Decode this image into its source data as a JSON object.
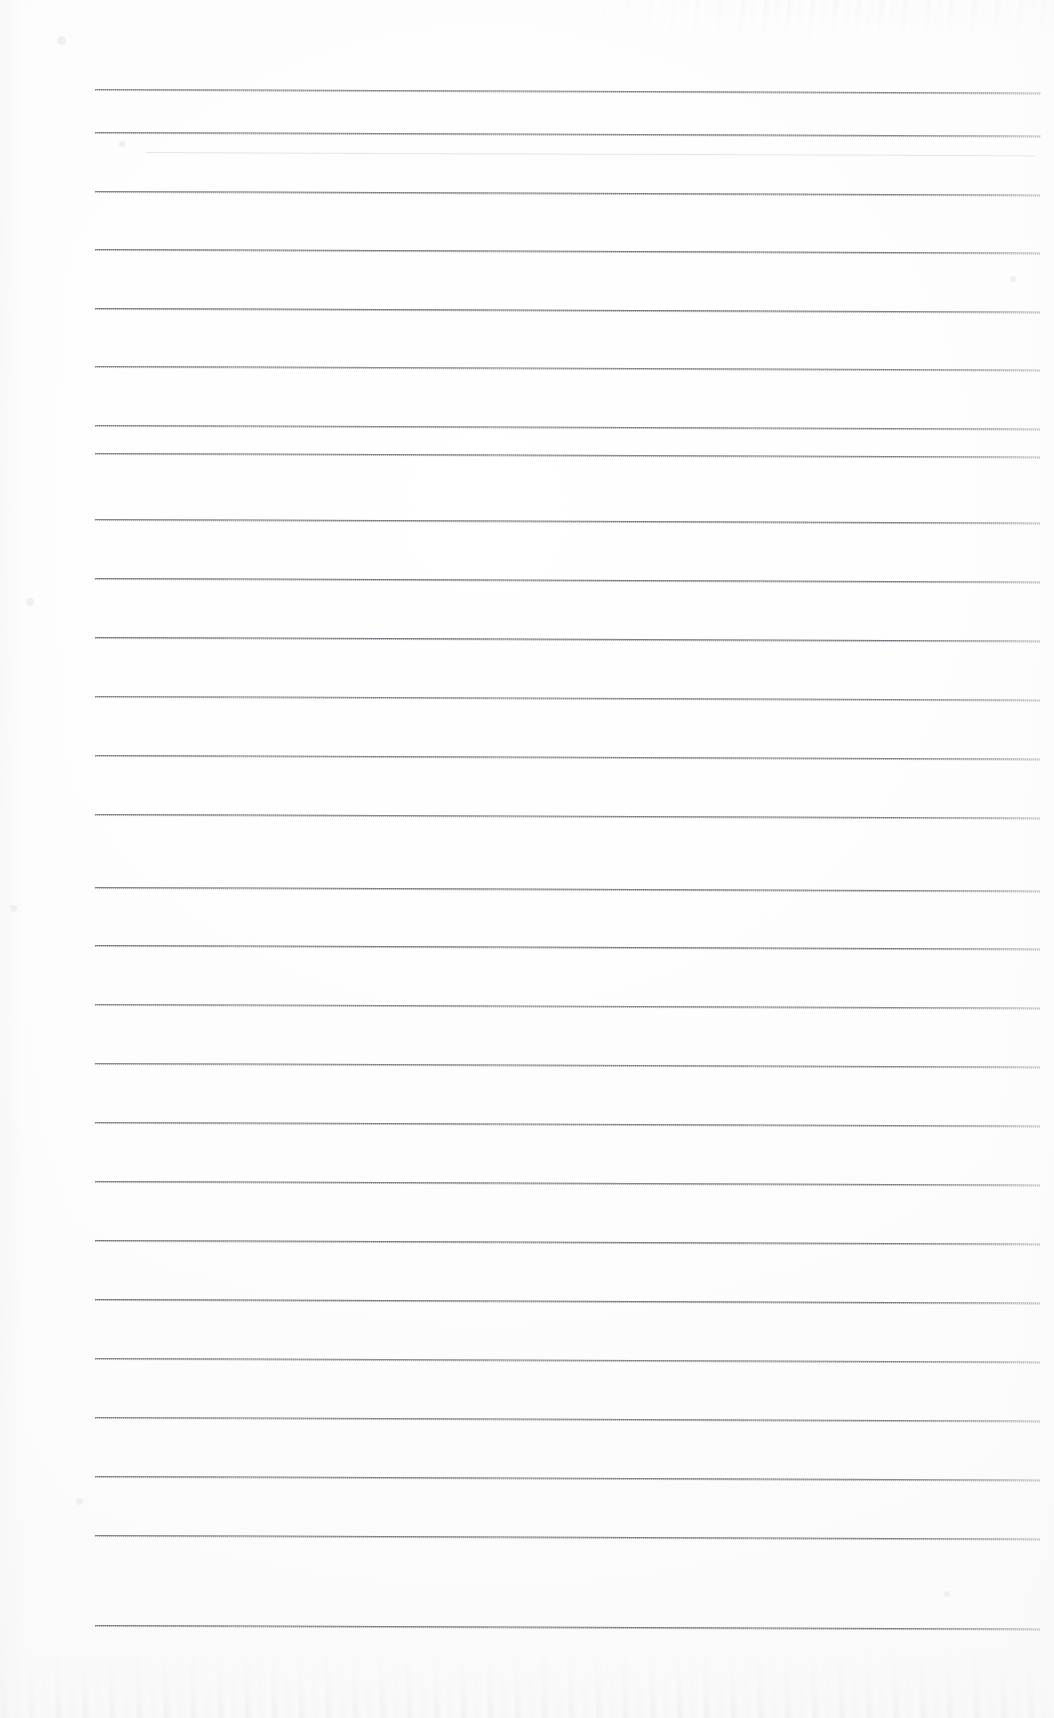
{
  "document": {
    "kind": "scanned-lined-notepad-page",
    "title": "Blank ruled notepad page",
    "page_width": 1054,
    "page_height": 1718,
    "background_color": "#fdfdfd",
    "text_content": "",
    "has_handwriting": false,
    "has_printed_text": false,
    "margin_rule_visible": false
  },
  "ruling": {
    "line_color": "#7a7a82",
    "ghost_line_color": "#d6d6dc",
    "line_thickness_px": 1,
    "line_start_x": 95,
    "line_end_x": 1040,
    "first_line_y": 89,
    "last_line_y": 1625,
    "nominal_spacing_px": 58.8,
    "skew_degrees": 0.22,
    "line_count": 27,
    "lines": [
      {
        "y": 89,
        "x1": 95,
        "x2": 1041,
        "style": "normal"
      },
      {
        "y": 132,
        "x1": 95,
        "x2": 1041,
        "style": "normal"
      },
      {
        "y": 152,
        "x1": 146,
        "x2": 1035,
        "style": "ghost"
      },
      {
        "y": 191,
        "x1": 95,
        "x2": 1040,
        "style": "normal"
      },
      {
        "y": 249,
        "x1": 95,
        "x2": 1040,
        "style": "normal"
      },
      {
        "y": 308,
        "x1": 95,
        "x2": 1040,
        "style": "normal"
      },
      {
        "y": 366,
        "x1": 95,
        "x2": 1040,
        "style": "normal"
      },
      {
        "y": 425,
        "x1": 95,
        "x2": 1040,
        "style": "normal"
      },
      {
        "y": 453,
        "x1": 95,
        "x2": 1040,
        "style": "normal"
      },
      {
        "y": 519,
        "x1": 95,
        "x2": 1040,
        "style": "normal"
      },
      {
        "y": 578,
        "x1": 95,
        "x2": 1040,
        "style": "normal"
      },
      {
        "y": 637,
        "x1": 95,
        "x2": 1040,
        "style": "normal"
      },
      {
        "y": 696,
        "x1": 95,
        "x2": 1040,
        "style": "normal"
      },
      {
        "y": 755,
        "x1": 95,
        "x2": 1040,
        "style": "normal"
      },
      {
        "y": 814,
        "x1": 95,
        "x2": 1040,
        "style": "normal"
      },
      {
        "y": 887,
        "x1": 95,
        "x2": 1040,
        "style": "normal"
      },
      {
        "y": 945,
        "x1": 95,
        "x2": 1040,
        "style": "normal"
      },
      {
        "y": 1004,
        "x1": 95,
        "x2": 1040,
        "style": "normal"
      },
      {
        "y": 1063,
        "x1": 95,
        "x2": 1040,
        "style": "normal"
      },
      {
        "y": 1122,
        "x1": 95,
        "x2": 1040,
        "style": "normal"
      },
      {
        "y": 1181,
        "x1": 95,
        "x2": 1040,
        "style": "normal"
      },
      {
        "y": 1240,
        "x1": 95,
        "x2": 1040,
        "style": "normal"
      },
      {
        "y": 1299,
        "x1": 95,
        "x2": 1040,
        "style": "normal"
      },
      {
        "y": 1358,
        "x1": 95,
        "x2": 1040,
        "style": "normal"
      },
      {
        "y": 1417,
        "x1": 95,
        "x2": 1040,
        "style": "normal"
      },
      {
        "y": 1476,
        "x1": 95,
        "x2": 1040,
        "style": "normal"
      },
      {
        "y": 1535,
        "x1": 95,
        "x2": 1040,
        "style": "normal"
      },
      {
        "y": 1625,
        "x1": 95,
        "x2": 1040,
        "style": "normal"
      }
    ]
  },
  "scan_artifacts": {
    "top_noise_band": {
      "y": 0,
      "height": 46,
      "color": "#ececed"
    },
    "bottom_noise_band": {
      "y": 1648,
      "height": 70,
      "color": "#ededef"
    },
    "specks": [
      {
        "x": 57,
        "y": 36,
        "size": 9
      },
      {
        "x": 119,
        "y": 141,
        "size": 6
      },
      {
        "x": 26,
        "y": 598,
        "size": 8
      },
      {
        "x": 10,
        "y": 905,
        "size": 7
      },
      {
        "x": 1010,
        "y": 276,
        "size": 6
      },
      {
        "x": 76,
        "y": 1498,
        "size": 7
      },
      {
        "x": 944,
        "y": 1591,
        "size": 6
      }
    ]
  }
}
